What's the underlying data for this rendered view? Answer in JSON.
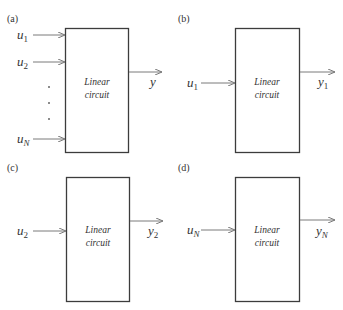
{
  "colors": {
    "box_stroke": "#3c3c3c",
    "wire": "#7a7a7a",
    "text": "#333333"
  },
  "panels": [
    {
      "label": "(a)",
      "box_text": [
        "Linear",
        "circuit"
      ],
      "inputs": [
        {
          "base": "u",
          "sub": "1"
        },
        {
          "base": "u",
          "sub": "2"
        },
        {
          "base": "u",
          "sub": "N"
        }
      ],
      "ellipsis": "⋮",
      "output": {
        "base": "y",
        "sub": ""
      }
    },
    {
      "label": "(b)",
      "box_text": [
        "Linear",
        "circuit"
      ],
      "inputs": [
        {
          "base": "u",
          "sub": "1"
        }
      ],
      "output": {
        "base": "y",
        "sub": "1"
      }
    },
    {
      "label": "(c)",
      "box_text": [
        "Linear",
        "circuit"
      ],
      "inputs": [
        {
          "base": "u",
          "sub": "2"
        }
      ],
      "output": {
        "base": "y",
        "sub": "2"
      }
    },
    {
      "label": "(d)",
      "box_text": [
        "Linear",
        "circuit"
      ],
      "inputs": [
        {
          "base": "u",
          "sub": "N"
        }
      ],
      "output": {
        "base": "y",
        "sub": "N"
      }
    }
  ]
}
